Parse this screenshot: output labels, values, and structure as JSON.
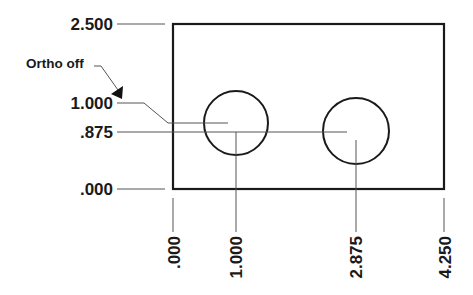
{
  "diagram": {
    "annotation": {
      "text": "Ortho off"
    },
    "y_dimensions": [
      {
        "label": "2.500",
        "value": 2.5
      },
      {
        "label": "1.000",
        "value": 1.0
      },
      {
        "label": ".875",
        "value": 0.875
      },
      {
        "label": ".000",
        "value": 0.0
      }
    ],
    "x_dimensions": [
      {
        "label": ".000",
        "value": 0.0
      },
      {
        "label": "1.000",
        "value": 1.0
      },
      {
        "label": "2.875",
        "value": 2.875
      },
      {
        "label": "4.250",
        "value": 4.25
      }
    ],
    "part": {
      "width": 4.25,
      "height": 2.5
    },
    "holes": [
      {
        "name": "hole-1",
        "x": 1.0,
        "y": 1.0
      },
      {
        "name": "hole-2",
        "x": 2.875,
        "y": 0.875
      }
    ],
    "colors": {
      "outline": "#1a1a1a",
      "leader": "#555555"
    }
  }
}
